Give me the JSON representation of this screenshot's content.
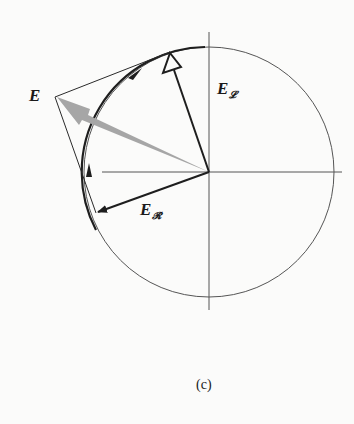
{
  "figure": {
    "caption": "(c)",
    "colors": {
      "line": "#2a2a2a",
      "resultant_arrow": "#a6a6a6",
      "background": "#fbfbfa"
    },
    "circle": {
      "cx": 209,
      "cy": 172,
      "r": 125
    },
    "axes": {
      "horizontal": {
        "x1": 102,
        "x2": 342,
        "y": 172
      },
      "vertical": {
        "y1": 32,
        "y2": 310,
        "x": 209
      }
    },
    "vectors": {
      "E": {
        "label": "E",
        "tip": [
          55,
          97
        ],
        "style": "thick-grey-arrow"
      },
      "E_L": {
        "label": "E",
        "subscript": "𝓛",
        "tip": [
          170,
          52
        ],
        "arrowhead": "open-triangle"
      },
      "E_R": {
        "label": "E",
        "subscript": "𝓡",
        "tip": [
          96,
          213
        ],
        "arrowhead": "filled"
      }
    },
    "parallelogram": {
      "edges": [
        [
          [
            170,
            52
          ],
          [
            55,
            97
          ]
        ],
        [
          [
            55,
            97
          ],
          [
            96,
            213
          ]
        ]
      ]
    },
    "arc_arrows": [
      {
        "at": [
          135,
          73
        ],
        "direction": "clockwise-up-right"
      },
      {
        "at": [
          89,
          170
        ],
        "direction": "up"
      }
    ]
  }
}
